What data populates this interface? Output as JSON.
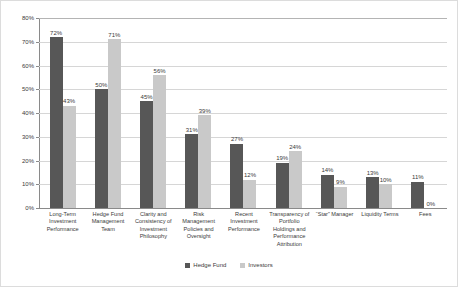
{
  "chart_data": {
    "type": "bar",
    "title": "",
    "subtitle": "",
    "xlabel": "",
    "ylabel": "",
    "ylim": [
      0,
      80
    ],
    "ytick_values": [
      0,
      10,
      20,
      30,
      40,
      50,
      60,
      70,
      80
    ],
    "ytick_labels": [
      "0%",
      "10%",
      "20%",
      "30%",
      "40%",
      "50%",
      "60%",
      "70%",
      "80%"
    ],
    "grid": true,
    "legend_position": "bottom-center",
    "value_suffix": "%",
    "categories": [
      "Long-Term Investment Performance",
      "Hedge Fund Management Team",
      "Clarity and Consistency of Investment Philosophy",
      "Risk Management Policies and Oversight",
      "Recent Investment Performance",
      "Transparency of Portfolio Holdings and Performance Attribution",
      "“Star” Manager",
      "Liquidity Terms",
      "Fees"
    ],
    "series": [
      {
        "name": "Hedge Fund",
        "color": "#575757",
        "values": [
          72,
          50,
          45,
          31,
          27,
          19,
          14,
          13,
          11
        ],
        "labels": [
          "72%",
          "50%",
          "45%",
          "31%",
          "27%",
          "19%",
          "14%",
          "13%",
          "11%"
        ]
      },
      {
        "name": "Investors",
        "color": "#c9c9c9",
        "values": [
          43,
          71,
          56,
          39,
          12,
          24,
          9,
          10,
          0
        ],
        "labels": [
          "43%",
          "71%",
          "56%",
          "39%",
          "12%",
          "24%",
          "9%",
          "10%",
          "0%"
        ]
      }
    ]
  },
  "colors": {
    "hedge_fund": "#575757",
    "investors": "#c9c9c9",
    "gridline": "#d6d6d6",
    "axis": "#8a8a8a",
    "border": "#dcdcdc",
    "text": "#3a3a3a"
  }
}
